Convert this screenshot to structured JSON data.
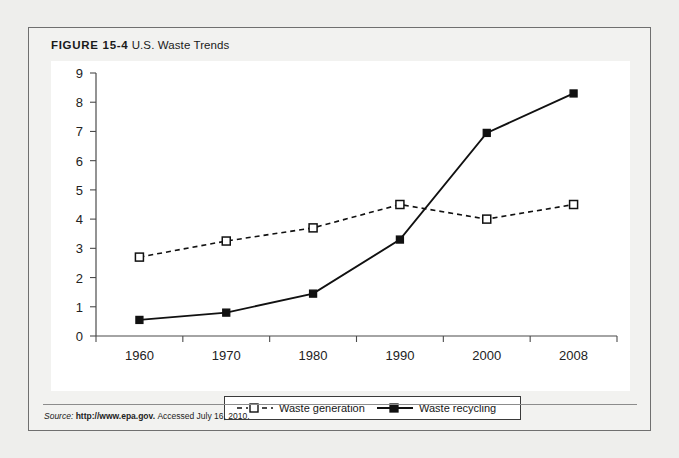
{
  "figure": {
    "label": "FIGURE 15-4",
    "title": "U.S. Waste Trends",
    "source_prefix": "Source:",
    "source_url": "http://www.epa.gov.",
    "source_accessed": "Accessed July 16, 2010."
  },
  "colors": {
    "page_background": "#eeeeec",
    "card_background": "#f2f2f0",
    "card_border": "#6f6f6f",
    "plot_background": "#ffffff",
    "axis": "#4b4b4b",
    "series": "#111111",
    "source_rule": "#8c8c8c"
  },
  "chart_data": {
    "type": "line",
    "title": "U.S. Waste Trends",
    "xlabel": "",
    "ylabel": "",
    "categories": [
      "1960",
      "1970",
      "1980",
      "1990",
      "2000",
      "2008"
    ],
    "x": [
      1960,
      1970,
      1980,
      1990,
      2000,
      2008
    ],
    "ylim": [
      0,
      9
    ],
    "yticks": [
      "0",
      "1",
      "2",
      "3",
      "4",
      "5",
      "6",
      "7",
      "8",
      "9"
    ],
    "ytick_values": [
      0,
      1,
      2,
      3,
      4,
      5,
      6,
      7,
      8,
      9
    ],
    "grid": false,
    "legend_position": "bottom",
    "series": [
      {
        "name": "Waste generation",
        "marker": "open-square",
        "line_style": "dashed",
        "values": [
          2.7,
          3.25,
          3.7,
          4.5,
          4.0,
          4.5
        ]
      },
      {
        "name": "Waste recycling",
        "marker": "filled-square",
        "line_style": "solid",
        "values": [
          0.55,
          0.8,
          1.45,
          3.3,
          6.95,
          8.3
        ]
      }
    ]
  },
  "legend": {
    "items": [
      {
        "label": "Waste generation"
      },
      {
        "label": "Waste recycling"
      }
    ]
  }
}
